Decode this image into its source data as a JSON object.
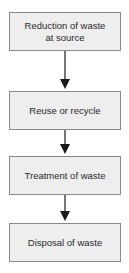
{
  "diagram": {
    "type": "flowchart",
    "direction": "top-to-bottom",
    "steps": [
      {
        "label": "Reduction of waste at source",
        "line1": "Reduction of waste",
        "line2": "at source"
      },
      {
        "label": "Reuse or recycle"
      },
      {
        "label": "Treatment of waste"
      },
      {
        "label": "Disposal of waste"
      }
    ],
    "edges": [
      {
        "from": 0,
        "to": 1
      },
      {
        "from": 1,
        "to": 2
      },
      {
        "from": 2,
        "to": 3
      }
    ],
    "colors": {
      "box_fill": "#eeeeee",
      "box_border": "#8a8a8a",
      "arrow": "#1a1a1a",
      "text": "#2a2a2a"
    }
  }
}
